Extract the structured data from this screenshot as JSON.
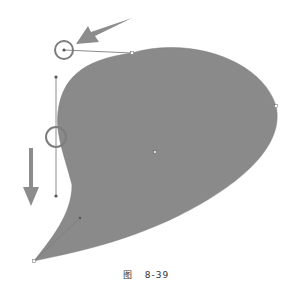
{
  "figure": {
    "caption_prefix": "图",
    "caption_number": "8-39",
    "colors": {
      "shape_fill": "#8a8a8a",
      "arrow_fill": "#8c8c8c",
      "handle_line": "#6e6e6e",
      "circle_stroke": "#7d7d7d",
      "background": "#ffffff"
    },
    "elements": {
      "shape": "teardrop-bezier-shape",
      "arrows": [
        "arrow-pointing-down-left",
        "arrow-pointing-down"
      ],
      "highlight_circles": [
        "top-handle-circle",
        "left-anchor-circle"
      ]
    }
  }
}
